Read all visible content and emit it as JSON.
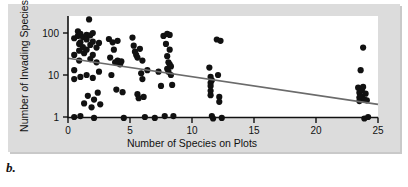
{
  "figure": {
    "caption": "b.",
    "background_color": "#dcdcdc",
    "plot_background_color": "#ffffff"
  },
  "chart_data": {
    "type": "scatter",
    "title": "",
    "xlabel": "Number of Species on Plots",
    "ylabel": "Number of Invading Species",
    "xlim": [
      0,
      25
    ],
    "ylim": [
      0.8,
      220
    ],
    "yscale": "log",
    "xscale": "linear",
    "grid": false,
    "legend": null,
    "xticks": [
      0,
      5,
      10,
      15,
      20,
      25
    ],
    "xtick_labels": [
      "0",
      "5",
      "10",
      "15",
      "20",
      "25"
    ],
    "yticks": [
      1,
      10,
      100
    ],
    "ytick_labels": [
      "1",
      "10",
      "100"
    ],
    "marker_color": "#111111",
    "marker_size": 3.1,
    "trendline": {
      "label": "regression line",
      "color": "#6b6b6b",
      "x": [
        0,
        25
      ],
      "y": [
        25,
        2
      ]
    },
    "points": [
      {
        "x": 0.5,
        "y": 75
      },
      {
        "x": 0.5,
        "y": 30
      },
      {
        "x": 0.5,
        "y": 13
      },
      {
        "x": 0.5,
        "y": 8
      },
      {
        "x": 0.5,
        "y": 1.0
      },
      {
        "x": 0.8,
        "y": 110
      },
      {
        "x": 0.8,
        "y": 85
      },
      {
        "x": 0.9,
        "y": 55
      },
      {
        "x": 0.9,
        "y": 38
      },
      {
        "x": 0.9,
        "y": 22
      },
      {
        "x": 1.0,
        "y": 95
      },
      {
        "x": 1.0,
        "y": 60
      },
      {
        "x": 1.0,
        "y": 9
      },
      {
        "x": 1.0,
        "y": 1.05
      },
      {
        "x": 1.2,
        "y": 80
      },
      {
        "x": 1.2,
        "y": 46
      },
      {
        "x": 1.3,
        "y": 33
      },
      {
        "x": 1.3,
        "y": 2.1
      },
      {
        "x": 1.5,
        "y": 90
      },
      {
        "x": 1.5,
        "y": 70
      },
      {
        "x": 1.5,
        "y": 40
      },
      {
        "x": 1.5,
        "y": 10
      },
      {
        "x": 1.6,
        "y": 3.2
      },
      {
        "x": 1.7,
        "y": 210
      },
      {
        "x": 1.8,
        "y": 88
      },
      {
        "x": 1.8,
        "y": 52
      },
      {
        "x": 1.8,
        "y": 24
      },
      {
        "x": 1.9,
        "y": 1.7
      },
      {
        "x": 2.0,
        "y": 100
      },
      {
        "x": 2.0,
        "y": 62
      },
      {
        "x": 2.0,
        "y": 30
      },
      {
        "x": 2.0,
        "y": 8.5
      },
      {
        "x": 2.1,
        "y": 2.6
      },
      {
        "x": 2.1,
        "y": 0.95
      },
      {
        "x": 2.3,
        "y": 45
      },
      {
        "x": 2.3,
        "y": 20
      },
      {
        "x": 2.4,
        "y": 3.8
      },
      {
        "x": 2.5,
        "y": 58
      },
      {
        "x": 2.5,
        "y": 12
      },
      {
        "x": 2.6,
        "y": 2.0
      },
      {
        "x": 3.3,
        "y": 72
      },
      {
        "x": 3.4,
        "y": 26
      },
      {
        "x": 3.5,
        "y": 10
      },
      {
        "x": 3.6,
        "y": 60
      },
      {
        "x": 3.7,
        "y": 40
      },
      {
        "x": 3.8,
        "y": 20
      },
      {
        "x": 3.9,
        "y": 4.5
      },
      {
        "x": 4.0,
        "y": 65
      },
      {
        "x": 4.0,
        "y": 22
      },
      {
        "x": 4.1,
        "y": 19
      },
      {
        "x": 4.2,
        "y": 18
      },
      {
        "x": 4.3,
        "y": 21
      },
      {
        "x": 4.4,
        "y": 3.9
      },
      {
        "x": 4.5,
        "y": 0.95
      },
      {
        "x": 5.2,
        "y": 78
      },
      {
        "x": 5.3,
        "y": 50
      },
      {
        "x": 5.4,
        "y": 36
      },
      {
        "x": 5.5,
        "y": 30
      },
      {
        "x": 5.6,
        "y": 26
      },
      {
        "x": 5.6,
        "y": 3.5
      },
      {
        "x": 5.7,
        "y": 2.8
      },
      {
        "x": 5.8,
        "y": 42
      },
      {
        "x": 5.9,
        "y": 11
      },
      {
        "x": 6.0,
        "y": 22
      },
      {
        "x": 6.0,
        "y": 8
      },
      {
        "x": 6.1,
        "y": 3.0
      },
      {
        "x": 6.2,
        "y": 1.0
      },
      {
        "x": 6.4,
        "y": 13
      },
      {
        "x": 7.0,
        "y": 0.95
      },
      {
        "x": 7.3,
        "y": 12
      },
      {
        "x": 7.5,
        "y": 5.5
      },
      {
        "x": 7.7,
        "y": 85
      },
      {
        "x": 7.8,
        "y": 1.05
      },
      {
        "x": 7.9,
        "y": 55
      },
      {
        "x": 8.0,
        "y": 95
      },
      {
        "x": 8.0,
        "y": 28
      },
      {
        "x": 8.0,
        "y": 14
      },
      {
        "x": 8.1,
        "y": 12
      },
      {
        "x": 8.1,
        "y": 20
      },
      {
        "x": 8.2,
        "y": 90
      },
      {
        "x": 8.2,
        "y": 40
      },
      {
        "x": 8.2,
        "y": 18
      },
      {
        "x": 8.3,
        "y": 16
      },
      {
        "x": 8.3,
        "y": 10
      },
      {
        "x": 8.4,
        "y": 5.8
      },
      {
        "x": 8.5,
        "y": 1.05
      },
      {
        "x": 11.4,
        "y": 15
      },
      {
        "x": 11.5,
        "y": 9
      },
      {
        "x": 11.5,
        "y": 6.5
      },
      {
        "x": 11.5,
        "y": 5.5
      },
      {
        "x": 11.5,
        "y": 4.2
      },
      {
        "x": 11.5,
        "y": 3.3
      },
      {
        "x": 11.6,
        "y": 7.5
      },
      {
        "x": 11.6,
        "y": 1.05
      },
      {
        "x": 11.7,
        "y": 0.92
      },
      {
        "x": 12.0,
        "y": 70
      },
      {
        "x": 12.1,
        "y": 10
      },
      {
        "x": 12.2,
        "y": 3.0
      },
      {
        "x": 12.2,
        "y": 2.3
      },
      {
        "x": 12.3,
        "y": 65
      },
      {
        "x": 12.4,
        "y": 0.95
      },
      {
        "x": 23.4,
        "y": 5.0
      },
      {
        "x": 23.5,
        "y": 3.8
      },
      {
        "x": 23.5,
        "y": 2.9
      },
      {
        "x": 23.5,
        "y": 2.4
      },
      {
        "x": 23.6,
        "y": 13
      },
      {
        "x": 23.7,
        "y": 4.4
      },
      {
        "x": 23.7,
        "y": 3.1
      },
      {
        "x": 23.8,
        "y": 45
      },
      {
        "x": 23.8,
        "y": 5.2
      },
      {
        "x": 23.9,
        "y": 2.6
      },
      {
        "x": 23.9,
        "y": 0.92
      },
      {
        "x": 24.0,
        "y": 3.6
      },
      {
        "x": 24.1,
        "y": 2.5
      },
      {
        "x": 24.2,
        "y": 1.0
      }
    ]
  }
}
